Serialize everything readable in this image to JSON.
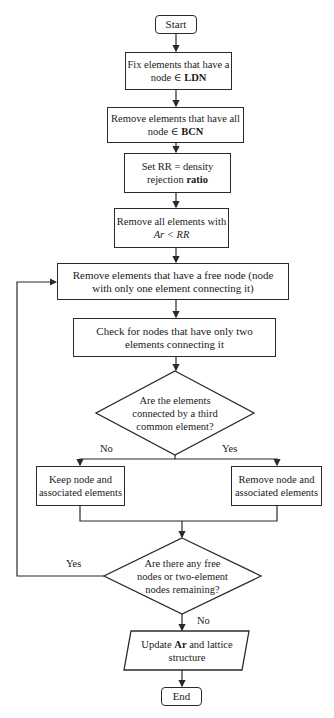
{
  "flowchart": {
    "start": "Start",
    "step1": {
      "line1": "Fix elements that have a",
      "line2_pre": "node ∈ ",
      "line2_bold": "LDN"
    },
    "step2": {
      "line1": "Remove elements that have all",
      "line2_pre": "node ∈ ",
      "line2_bold": "BCN"
    },
    "step3": {
      "line1": "Set RR = density",
      "line2_pre": "rejection ",
      "line2_bold": "ratio"
    },
    "step4": {
      "line1": "Remove all elements with",
      "line2_italic": "Ar < RR"
    },
    "step5": {
      "line1": "Remove elements that have a free node (node",
      "line2": "with only one element connecting it)"
    },
    "step6": {
      "line1": "Check for nodes that have only two",
      "line2": "elements connecting it"
    },
    "decision1": {
      "line1": "Are the elements",
      "line2": "connected by a third",
      "line3": "common element?"
    },
    "decision1_no": "No",
    "decision1_yes": "Yes",
    "keep": {
      "line1": "Keep node and",
      "line2": "associated elements"
    },
    "remove": {
      "line1": "Remove node and",
      "line2": "associated elements"
    },
    "decision2": {
      "line1": "Are there any free",
      "line2": "nodes or two-element",
      "line3": "nodes remaining?"
    },
    "decision2_yes": "Yes",
    "decision2_no": "No",
    "update": {
      "line1_pre": "Update ",
      "line1_bold": "Ar",
      "line1_post": " and lattice",
      "line2": "structure"
    },
    "end": "End"
  }
}
